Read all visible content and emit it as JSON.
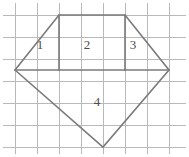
{
  "figure": {
    "background_color": "#ffffff",
    "grid": {
      "line_color": "#b9b9b9",
      "cell_size": 22,
      "vertical_lines_x": [
        15,
        37,
        59,
        81,
        103,
        125,
        147,
        169
      ],
      "horizontal_lines_y": [
        15,
        37,
        59,
        81,
        103,
        125,
        147
      ],
      "x_extent": [
        3,
        186
      ],
      "y_extent": [
        3,
        154
      ],
      "columns": 8,
      "rows": 7
    },
    "polygon": {
      "stroke_color": "#7a7a7a",
      "stroke_width": 1.6,
      "name": "pentagon",
      "vertices": [
        {
          "name": "left-vertex",
          "x": 15,
          "y": 70
        },
        {
          "name": "top-left-vertex",
          "x": 59,
          "y": 15
        },
        {
          "name": "top-right-vertex",
          "x": 125,
          "y": 15
        },
        {
          "name": "right-vertex",
          "x": 169,
          "y": 70
        },
        {
          "name": "bottom-vertex",
          "x": 103,
          "y": 147
        }
      ],
      "outline_path": "M 15 70 L 59 15 L 125 15 L 169 70 L 103 147 Z",
      "internal_segments": [
        {
          "name": "horizontal-divider",
          "x1": 15,
          "y1": 70,
          "x2": 169,
          "y2": 70
        },
        {
          "name": "left-vertical-divider",
          "x1": 59,
          "y1": 15,
          "x2": 59,
          "y2": 70
        },
        {
          "name": "right-vertical-divider",
          "x1": 125,
          "y1": 15,
          "x2": 125,
          "y2": 70
        }
      ]
    },
    "region_labels": [
      {
        "id": "region-1",
        "text": "1",
        "x": 40,
        "y": 45
      },
      {
        "id": "region-2",
        "text": "2",
        "x": 87,
        "y": 45
      },
      {
        "id": "region-3",
        "text": "3",
        "x": 133,
        "y": 45
      },
      {
        "id": "region-4",
        "text": "4",
        "x": 97,
        "y": 102
      }
    ]
  }
}
